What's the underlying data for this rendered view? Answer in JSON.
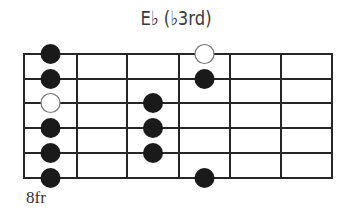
{
  "diagram": {
    "title": "E♭ (♭3rd)",
    "fret_label": "8fr",
    "strings": 6,
    "frets_shown": 6,
    "grid": {
      "x_lines": [
        24,
        77,
        127,
        179,
        230,
        281,
        332
      ],
      "y_lines": [
        54,
        79,
        103,
        128,
        153,
        178
      ],
      "line_color": "#262626"
    },
    "dot_radius": 10,
    "dot_color": "#1a1a1a",
    "open_dot_stroke": "#777777",
    "notes": [
      {
        "fret_cell": 1,
        "string": 1,
        "type": "filled"
      },
      {
        "fret_cell": 1,
        "string": 2,
        "type": "filled"
      },
      {
        "fret_cell": 1,
        "string": 3,
        "type": "open"
      },
      {
        "fret_cell": 1,
        "string": 4,
        "type": "filled"
      },
      {
        "fret_cell": 1,
        "string": 5,
        "type": "filled"
      },
      {
        "fret_cell": 1,
        "string": 6,
        "type": "filled"
      },
      {
        "fret_cell": 3,
        "string": 3,
        "type": "filled"
      },
      {
        "fret_cell": 3,
        "string": 4,
        "type": "filled"
      },
      {
        "fret_cell": 3,
        "string": 5,
        "type": "filled"
      },
      {
        "fret_cell": 4,
        "string": 1,
        "type": "open"
      },
      {
        "fret_cell": 4,
        "string": 2,
        "type": "filled"
      },
      {
        "fret_cell": 4,
        "string": 6,
        "type": "filled"
      }
    ]
  }
}
